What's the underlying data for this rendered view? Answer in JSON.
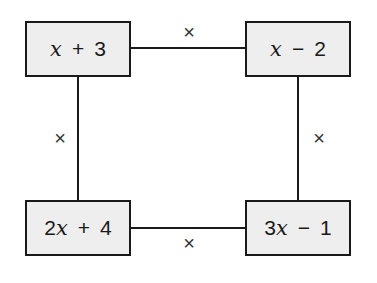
{
  "diagram": {
    "boxes": [
      {
        "id": "top-left",
        "label": "x + 3"
      },
      {
        "id": "top-right",
        "label": "x − 2"
      },
      {
        "id": "bottom-left",
        "label": "2x + 4"
      },
      {
        "id": "bottom-right",
        "label": "3x − 1"
      }
    ],
    "operators": {
      "top": "×",
      "left": "×",
      "right": "×",
      "bottom": "×"
    },
    "colors": {
      "box_fill": "#eeeeee",
      "stroke": "#1a1a1a"
    }
  }
}
